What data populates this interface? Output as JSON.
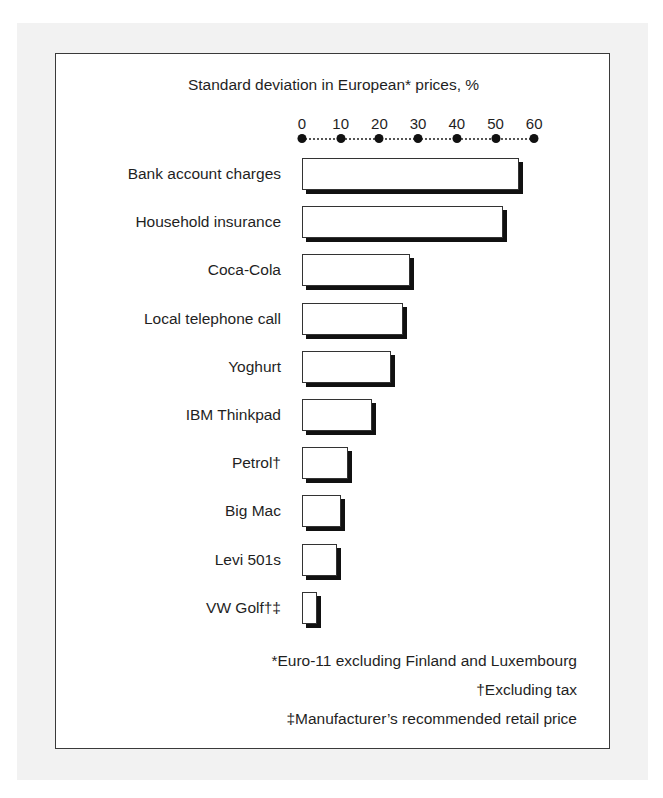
{
  "chart_data": {
    "type": "bar",
    "orientation": "horizontal",
    "title": "Standard deviation in European* prices, %",
    "xlabel": "",
    "ylabel": "",
    "xlim": [
      0,
      60
    ],
    "x_ticks": [
      "0",
      "10",
      "20",
      "30",
      "40",
      "50",
      "60"
    ],
    "grid": false,
    "legend": null,
    "categories": [
      "Bank account charges",
      "Household insurance",
      "Coca-Cola",
      "Local telephone call",
      "Yoghurt",
      "IBM Thinkpad",
      "Petrol†",
      "Big Mac",
      "Levi 501s",
      "VW Golf†‡"
    ],
    "values": [
      56,
      52,
      28,
      26,
      23,
      18,
      12,
      10,
      9,
      4
    ],
    "footnotes": [
      "*Euro-11 excluding Finland and Luxembourg",
      "†Excluding tax",
      "‡Manufacturer’s recommended retail price"
    ]
  },
  "colors": {
    "bar_fill": "#ffffff",
    "bar_border": "#333333",
    "bar_shadow": "#111111",
    "page_background": "#f2f2f2"
  }
}
